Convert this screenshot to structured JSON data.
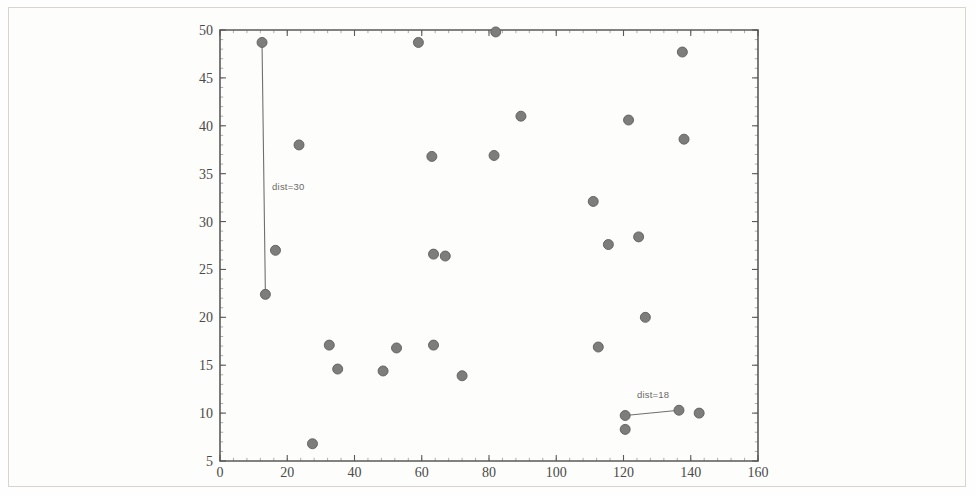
{
  "figure": {
    "background_color": "#fefefe",
    "border_color": "#d8d5cf",
    "marker_color": "#7d7d7b",
    "axis_color": "#5a5a58",
    "annotation_color": "#6a6a67"
  },
  "chart_data": {
    "type": "scatter",
    "title": "",
    "subtitle": "",
    "xlabel": "",
    "ylabel": "",
    "xlim": [
      0,
      160
    ],
    "ylim": [
      5,
      50
    ],
    "xticks": [
      0,
      20,
      40,
      60,
      80,
      100,
      120,
      140,
      160
    ],
    "xtick_labels": [
      "0",
      "20",
      "40",
      "60",
      "80",
      "100",
      "120",
      "140",
      "160"
    ],
    "yticks": [
      5,
      10,
      15,
      20,
      25,
      30,
      35,
      40,
      45,
      50
    ],
    "ytick_labels": [
      "5",
      "10",
      "15",
      "20",
      "25",
      "30",
      "35",
      "40",
      "45",
      "50"
    ],
    "grid": false,
    "legend": null,
    "minor_ticks": true,
    "marker": "circle",
    "marker_size": 5,
    "points": [
      {
        "x": 12.5,
        "y": 48.7
      },
      {
        "x": 16.5,
        "y": 27.0
      },
      {
        "x": 13.5,
        "y": 22.4
      },
      {
        "x": 23.5,
        "y": 38.0
      },
      {
        "x": 27.5,
        "y": 6.8
      },
      {
        "x": 32.5,
        "y": 17.1
      },
      {
        "x": 35.0,
        "y": 14.6
      },
      {
        "x": 48.5,
        "y": 14.4
      },
      {
        "x": 52.5,
        "y": 16.8
      },
      {
        "x": 59.0,
        "y": 48.7
      },
      {
        "x": 63.0,
        "y": 36.8
      },
      {
        "x": 63.5,
        "y": 17.1
      },
      {
        "x": 63.5,
        "y": 26.6
      },
      {
        "x": 67.0,
        "y": 26.4
      },
      {
        "x": 72.0,
        "y": 13.9
      },
      {
        "x": 82.0,
        "y": 49.8
      },
      {
        "x": 81.5,
        "y": 36.9
      },
      {
        "x": 89.5,
        "y": 41.0
      },
      {
        "x": 111.0,
        "y": 32.1
      },
      {
        "x": 112.5,
        "y": 16.9
      },
      {
        "x": 115.5,
        "y": 27.6
      },
      {
        "x": 120.5,
        "y": 9.75
      },
      {
        "x": 120.5,
        "y": 8.3
      },
      {
        "x": 121.5,
        "y": 40.6
      },
      {
        "x": 124.5,
        "y": 28.4
      },
      {
        "x": 126.5,
        "y": 20.0
      },
      {
        "x": 136.5,
        "y": 10.3
      },
      {
        "x": 137.5,
        "y": 47.7
      },
      {
        "x": 138.0,
        "y": 38.6
      },
      {
        "x": 142.5,
        "y": 10.0
      }
    ],
    "annotations": [
      {
        "label": "dist=30",
        "from": {
          "x": 12.5,
          "y": 48.7
        },
        "to": {
          "x": 13.5,
          "y": 22.4
        },
        "label_x": 15.5,
        "label_y": 33.3
      },
      {
        "label": "dist=18",
        "from": {
          "x": 120.5,
          "y": 9.75
        },
        "to": {
          "x": 136.5,
          "y": 10.3
        },
        "label_x": 124.0,
        "label_y": 11.6
      }
    ]
  }
}
